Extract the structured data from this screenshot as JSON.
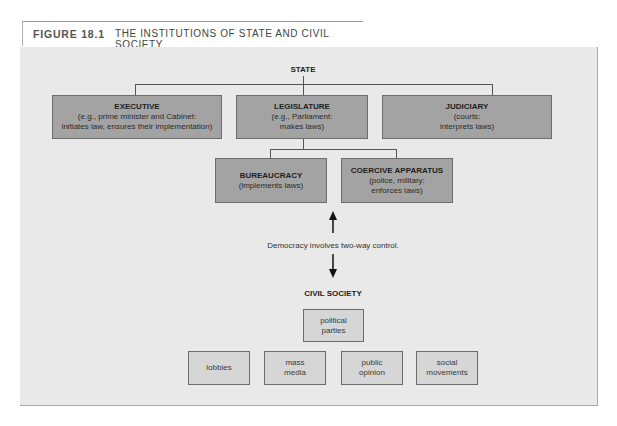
{
  "header": {
    "figure_number": "FIGURE 18.1",
    "title": "THE INSTITUTIONS OF STATE AND CIVIL SOCIETY"
  },
  "diagram": {
    "state_label": "STATE",
    "state_branches": [
      {
        "title": "EXECUTIVE",
        "desc1": "(e.g., prime minister and Cabinet:",
        "desc2": "initiates law, ensures their implementation)"
      },
      {
        "title": "LEGISLATURE",
        "desc1": "(e.g., Parliament:",
        "desc2": "makes laws)"
      },
      {
        "title": "JUDICIARY",
        "desc1": "(courts:",
        "desc2": "interprets laws)"
      }
    ],
    "sub_branches": [
      {
        "title": "BUREAUCRACY",
        "desc1": "(implements laws)"
      },
      {
        "title": "COERCIVE APPARATUS",
        "desc1": "(police, military:",
        "desc2": "enforces laws)"
      }
    ],
    "arrow_caption": "Democracy involves two-way control.",
    "civil_society_label": "CIVIL SOCIETY",
    "civil_society_top": {
      "line1": "political",
      "line2": "parties"
    },
    "civil_society_items": [
      {
        "line1": "lobbies"
      },
      {
        "line1": "mass",
        "line2": "media"
      },
      {
        "line1": "public",
        "line2": "opinion"
      },
      {
        "line1": "social",
        "line2": "movements"
      }
    ]
  }
}
